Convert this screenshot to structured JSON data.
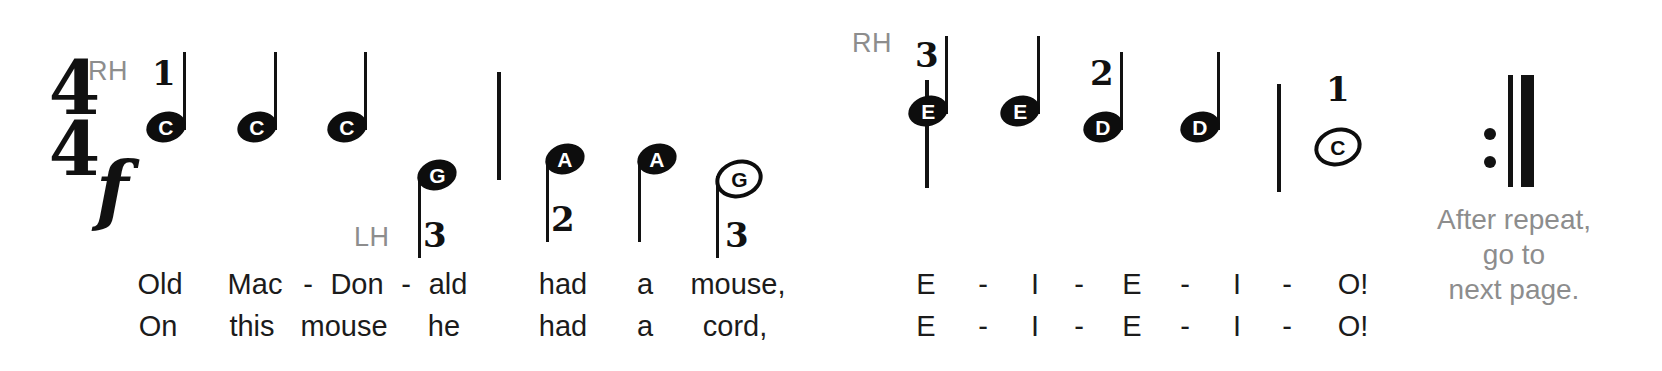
{
  "score": {
    "time_signature": {
      "numerator": "4",
      "denominator": "4"
    },
    "dynamic": "f",
    "hand_labels": [
      {
        "id": "rh-left",
        "text": "RH",
        "x": 88,
        "y": 56
      },
      {
        "id": "lh-left",
        "text": "LH",
        "x": 354,
        "y": 222
      },
      {
        "id": "rh-right",
        "text": "RH",
        "x": 852,
        "y": 28
      }
    ],
    "notes": [
      {
        "id": "n1",
        "letter": "C",
        "head": "filled",
        "stem": "up",
        "finger": "1",
        "x": 146,
        "y": 112,
        "stem_top": 52,
        "stem_h": 78,
        "finger_x": 152,
        "finger_y": 56
      },
      {
        "id": "n2",
        "letter": "C",
        "head": "filled",
        "stem": "up",
        "finger": "",
        "x": 237,
        "y": 112,
        "stem_top": 52,
        "stem_h": 78,
        "finger_x": 0,
        "finger_y": 0
      },
      {
        "id": "n3",
        "letter": "C",
        "head": "filled",
        "stem": "up",
        "finger": "",
        "x": 327,
        "y": 112,
        "stem_top": 52,
        "stem_h": 78,
        "finger_x": 0,
        "finger_y": 0
      },
      {
        "id": "n4",
        "letter": "G",
        "head": "filled",
        "stem": "down",
        "finger": "3",
        "x": 417,
        "y": 160,
        "stem_top": 176,
        "stem_h": 82,
        "finger_x": 423,
        "finger_y": 218
      },
      {
        "id": "n5",
        "letter": "A",
        "head": "filled",
        "stem": "down",
        "finger": "2",
        "x": 545,
        "y": 144,
        "stem_top": 160,
        "stem_h": 82,
        "finger_x": 551,
        "finger_y": 202
      },
      {
        "id": "n6",
        "letter": "A",
        "head": "filled",
        "stem": "down",
        "finger": "",
        "x": 637,
        "y": 144,
        "stem_top": 160,
        "stem_h": 82,
        "finger_x": 0,
        "finger_y": 0
      },
      {
        "id": "n7",
        "letter": "G",
        "head": "hollow",
        "stem": "down",
        "finger": "3",
        "x": 715,
        "y": 160,
        "stem_top": 176,
        "stem_h": 82,
        "finger_x": 725,
        "finger_y": 218
      },
      {
        "id": "n8",
        "letter": "E",
        "head": "filled",
        "stem": "up",
        "finger": "3",
        "x": 908,
        "y": 96,
        "stem_top": 36,
        "stem_h": 78,
        "finger_x": 915,
        "finger_y": 38
      },
      {
        "id": "n9",
        "letter": "E",
        "head": "filled",
        "stem": "up",
        "finger": "",
        "x": 1000,
        "y": 96,
        "stem_top": 36,
        "stem_h": 78,
        "finger_x": 0,
        "finger_y": 0
      },
      {
        "id": "n10",
        "letter": "D",
        "head": "filled",
        "stem": "up",
        "finger": "2",
        "x": 1083,
        "y": 112,
        "stem_top": 52,
        "stem_h": 78,
        "finger_x": 1090,
        "finger_y": 56
      },
      {
        "id": "n11",
        "letter": "D",
        "head": "filled",
        "stem": "up",
        "finger": "",
        "x": 1180,
        "y": 112,
        "stem_top": 52,
        "stem_h": 78,
        "finger_x": 0,
        "finger_y": 0
      },
      {
        "id": "n12",
        "letter": "C",
        "head": "hollow",
        "stem": "none",
        "finger": "1",
        "x": 1314,
        "y": 128,
        "stem_top": 0,
        "stem_h": 0,
        "finger_x": 1326,
        "finger_y": 72
      }
    ],
    "barlines": [
      {
        "id": "bar1",
        "x": 497,
        "y": 72,
        "h": 108
      },
      {
        "id": "bar2",
        "x": 925,
        "y": 80,
        "h": 108
      },
      {
        "id": "bar3",
        "x": 1277,
        "y": 84,
        "h": 108
      }
    ],
    "repeat": {
      "dot_x": 1484,
      "dot_top_y": 128,
      "dot_bottom_y": 156,
      "thin_x": 1508,
      "thick_x": 1521,
      "y": 75,
      "h": 112
    },
    "lyrics": {
      "line1": [
        {
          "text": "Old",
          "x": 160,
          "y": 268
        },
        {
          "text": "Mac",
          "x": 255,
          "y": 268
        },
        {
          "text": "-",
          "x": 308,
          "y": 268
        },
        {
          "text": "Don",
          "x": 357,
          "y": 268
        },
        {
          "text": "-",
          "x": 406,
          "y": 268
        },
        {
          "text": "ald",
          "x": 448,
          "y": 268
        },
        {
          "text": "had",
          "x": 563,
          "y": 268
        },
        {
          "text": "a",
          "x": 645,
          "y": 268
        },
        {
          "text": "mouse,",
          "x": 738,
          "y": 268
        },
        {
          "text": "E",
          "x": 926,
          "y": 268
        },
        {
          "text": "-",
          "x": 983,
          "y": 268
        },
        {
          "text": "I",
          "x": 1035,
          "y": 268
        },
        {
          "text": "-",
          "x": 1079,
          "y": 268
        },
        {
          "text": "E",
          "x": 1132,
          "y": 268
        },
        {
          "text": "-",
          "x": 1185,
          "y": 268
        },
        {
          "text": "I",
          "x": 1237,
          "y": 268
        },
        {
          "text": "-",
          "x": 1287,
          "y": 268
        },
        {
          "text": "O!",
          "x": 1353,
          "y": 268
        }
      ],
      "line2": [
        {
          "text": "On",
          "x": 158,
          "y": 310
        },
        {
          "text": "this",
          "x": 252,
          "y": 310
        },
        {
          "text": "mouse",
          "x": 344,
          "y": 310
        },
        {
          "text": "he",
          "x": 444,
          "y": 310
        },
        {
          "text": "had",
          "x": 563,
          "y": 310
        },
        {
          "text": "a",
          "x": 645,
          "y": 310
        },
        {
          "text": "cord,",
          "x": 735,
          "y": 310
        },
        {
          "text": "E",
          "x": 926,
          "y": 310
        },
        {
          "text": "-",
          "x": 983,
          "y": 310
        },
        {
          "text": "I",
          "x": 1035,
          "y": 310
        },
        {
          "text": "-",
          "x": 1079,
          "y": 310
        },
        {
          "text": "E",
          "x": 1132,
          "y": 310
        },
        {
          "text": "-",
          "x": 1185,
          "y": 310
        },
        {
          "text": "I",
          "x": 1237,
          "y": 310
        },
        {
          "text": "-",
          "x": 1287,
          "y": 310
        },
        {
          "text": "O!",
          "x": 1353,
          "y": 310
        }
      ]
    },
    "side_note": {
      "lines": [
        "After repeat,",
        "go to",
        "next page."
      ],
      "x": 1394,
      "y": 202,
      "width": 240
    },
    "colors": {
      "ink": "#121212",
      "gray": "#8d8d8d",
      "paper": "#ffffff"
    }
  }
}
